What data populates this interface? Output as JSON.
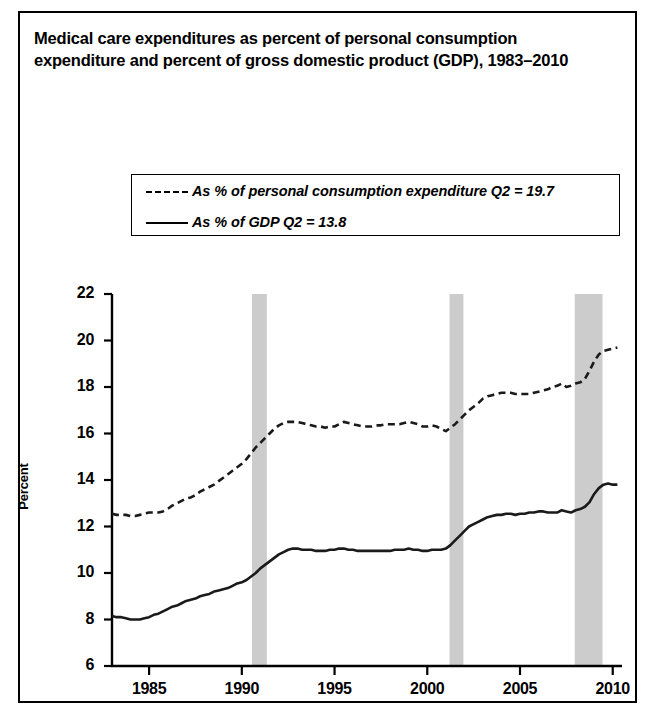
{
  "title": "Medical care expenditures as percent of personal consumption expenditure and percent of gross domestic product (GDP), 1983–2010",
  "axis": {
    "ylabel": "Percent"
  },
  "legend": {
    "items": [
      {
        "key": "dashed",
        "label": "As % of personal consumption expenditure Q2 = 19.7"
      },
      {
        "key": "solid",
        "label": "As % of GDP Q2 = 13.8"
      }
    ]
  },
  "chart_data": {
    "type": "line",
    "title": "Medical care expenditures as percent of personal consumption expenditure and percent of gross domestic product (GDP), 1983–2010",
    "xlabel": "",
    "ylabel": "Percent",
    "xlim": [
      1983.0,
      2010.5
    ],
    "ylim": [
      6,
      22
    ],
    "xticks": [
      1985,
      1990,
      1995,
      2000,
      2005,
      2010
    ],
    "yticks": [
      6,
      8,
      10,
      12,
      14,
      16,
      18,
      20,
      22
    ],
    "grid": false,
    "legend_position": "upper-center-outside",
    "annotations": [
      {
        "text": "Q2 = 19.7",
        "series": "As % of personal consumption expenditure",
        "value": 19.7
      },
      {
        "text": "Q2 = 13.8",
        "series": "As % of GDP",
        "value": 13.8
      }
    ],
    "shaded_bands": {
      "name": "recession-bands",
      "color": "#cccccc",
      "ranges": [
        {
          "start": 1990.55,
          "end": 1991.35
        },
        {
          "start": 2001.2,
          "end": 2001.95
        },
        {
          "start": 2007.95,
          "end": 2009.45
        }
      ]
    },
    "x": [
      1983.0,
      1983.25,
      1983.5,
      1983.75,
      1984.0,
      1984.25,
      1984.5,
      1984.75,
      1985.0,
      1985.25,
      1985.5,
      1985.75,
      1986.0,
      1986.25,
      1986.5,
      1986.75,
      1987.0,
      1987.25,
      1987.5,
      1987.75,
      1988.0,
      1988.25,
      1988.5,
      1988.75,
      1989.0,
      1989.25,
      1989.5,
      1989.75,
      1990.0,
      1990.25,
      1990.5,
      1990.75,
      1991.0,
      1991.25,
      1991.5,
      1991.75,
      1992.0,
      1992.25,
      1992.5,
      1992.75,
      1993.0,
      1993.25,
      1993.5,
      1993.75,
      1994.0,
      1994.25,
      1994.5,
      1994.75,
      1995.0,
      1995.25,
      1995.5,
      1995.75,
      1996.0,
      1996.25,
      1996.5,
      1996.75,
      1997.0,
      1997.25,
      1997.5,
      1997.75,
      1998.0,
      1998.25,
      1998.5,
      1998.75,
      1999.0,
      1999.25,
      1999.5,
      1999.75,
      2000.0,
      2000.25,
      2000.5,
      2000.75,
      2001.0,
      2001.25,
      2001.5,
      2001.75,
      2002.0,
      2002.25,
      2002.5,
      2002.75,
      2003.0,
      2003.25,
      2003.5,
      2003.75,
      2004.0,
      2004.25,
      2004.5,
      2004.75,
      2005.0,
      2005.25,
      2005.5,
      2005.75,
      2006.0,
      2006.25,
      2006.5,
      2006.75,
      2007.0,
      2007.25,
      2007.5,
      2007.75,
      2008.0,
      2008.25,
      2008.5,
      2008.75,
      2009.0,
      2009.25,
      2009.5,
      2009.75,
      2010.0,
      2010.25
    ],
    "series": [
      {
        "name": "As % of personal consumption expenditure",
        "style": "dashed",
        "last_value": 19.7,
        "values": [
          12.55,
          12.5,
          12.5,
          12.5,
          12.45,
          12.45,
          12.5,
          12.55,
          12.6,
          12.6,
          12.6,
          12.65,
          12.75,
          12.9,
          13.0,
          13.1,
          13.2,
          13.25,
          13.35,
          13.5,
          13.6,
          13.7,
          13.8,
          13.95,
          14.1,
          14.25,
          14.4,
          14.55,
          14.7,
          14.9,
          15.15,
          15.4,
          15.6,
          15.8,
          16.0,
          16.2,
          16.35,
          16.45,
          16.5,
          16.5,
          16.5,
          16.45,
          16.4,
          16.35,
          16.3,
          16.3,
          16.25,
          16.3,
          16.3,
          16.4,
          16.5,
          16.45,
          16.4,
          16.35,
          16.3,
          16.3,
          16.3,
          16.35,
          16.35,
          16.4,
          16.4,
          16.4,
          16.4,
          16.45,
          16.5,
          16.45,
          16.4,
          16.3,
          16.3,
          16.35,
          16.3,
          16.2,
          16.1,
          16.25,
          16.4,
          16.6,
          16.8,
          17.0,
          17.15,
          17.3,
          17.5,
          17.6,
          17.65,
          17.7,
          17.75,
          17.75,
          17.75,
          17.7,
          17.7,
          17.7,
          17.7,
          17.75,
          17.8,
          17.85,
          17.9,
          18.0,
          18.05,
          18.15,
          18.0,
          18.05,
          18.15,
          18.2,
          18.35,
          18.7,
          19.1,
          19.4,
          19.55,
          19.6,
          19.65,
          19.7
        ]
      },
      {
        "name": "As % of GDP",
        "style": "solid",
        "last_value": 13.8,
        "values": [
          8.15,
          8.1,
          8.1,
          8.05,
          8.0,
          8.0,
          8.0,
          8.05,
          8.1,
          8.2,
          8.25,
          8.35,
          8.45,
          8.55,
          8.6,
          8.7,
          8.8,
          8.85,
          8.9,
          9.0,
          9.05,
          9.1,
          9.2,
          9.25,
          9.3,
          9.35,
          9.45,
          9.55,
          9.6,
          9.7,
          9.85,
          10.0,
          10.2,
          10.35,
          10.5,
          10.65,
          10.8,
          10.9,
          11.0,
          11.05,
          11.05,
          11.0,
          11.0,
          11.0,
          10.95,
          10.95,
          10.95,
          11.0,
          11.0,
          11.05,
          11.05,
          11.0,
          11.0,
          10.95,
          10.95,
          10.95,
          10.95,
          10.95,
          10.95,
          10.95,
          10.95,
          11.0,
          11.0,
          11.0,
          11.05,
          11.0,
          11.0,
          10.95,
          10.95,
          11.0,
          11.0,
          11.0,
          11.05,
          11.2,
          11.4,
          11.6,
          11.8,
          12.0,
          12.1,
          12.2,
          12.3,
          12.4,
          12.45,
          12.5,
          12.5,
          12.55,
          12.55,
          12.5,
          12.55,
          12.55,
          12.6,
          12.6,
          12.65,
          12.65,
          12.6,
          12.6,
          12.6,
          12.7,
          12.65,
          12.6,
          12.7,
          12.75,
          12.85,
          13.05,
          13.4,
          13.65,
          13.8,
          13.85,
          13.8,
          13.8
        ]
      }
    ]
  }
}
